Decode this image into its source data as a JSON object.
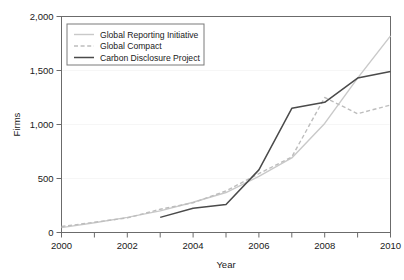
{
  "chart_data": {
    "type": "line",
    "title": "",
    "xlabel": "Year",
    "ylabel": "Firms",
    "xlim": [
      2000,
      2010
    ],
    "ylim": [
      0,
      2000
    ],
    "grid": false,
    "legend_position": "top-left",
    "x": [
      2000,
      2001,
      2002,
      2003,
      2004,
      2005,
      2006,
      2007,
      2008,
      2009,
      2010
    ],
    "x_ticks": [
      2000,
      2001,
      2002,
      2003,
      2004,
      2005,
      2006,
      2007,
      2008,
      2009,
      2010
    ],
    "x_tick_labels": [
      "2000",
      "",
      "2002",
      "",
      "2004",
      "",
      "2006",
      "",
      "2008",
      "",
      "2010"
    ],
    "y_ticks": [
      0,
      500,
      1000,
      1500,
      2000
    ],
    "y_tick_labels": [
      "0",
      "500",
      "1,000",
      "1,500",
      "2,000"
    ],
    "series": [
      {
        "name": "Global Reporting Initiative",
        "color": "#c9c9c9",
        "style": "solid",
        "x": [
          2000,
          2001,
          2002,
          2003,
          2004,
          2005,
          2006,
          2007,
          2008,
          2009,
          2010
        ],
        "values": [
          45,
          90,
          140,
          200,
          280,
          370,
          520,
          690,
          1010,
          1430,
          1820
        ]
      },
      {
        "name": "Global Compact",
        "color": "#bdbdbd",
        "style": "dashed",
        "x": [
          2000,
          2001,
          2002,
          2003,
          2004,
          2005,
          2006,
          2007,
          2008,
          2009,
          2010
        ],
        "values": [
          55,
          95,
          135,
          215,
          275,
          385,
          545,
          700,
          1250,
          1100,
          1180
        ]
      },
      {
        "name": "Carbon Disclosure Project",
        "color": "#4a4a4a",
        "style": "solid",
        "x": [
          2003,
          2004,
          2005,
          2006,
          2007,
          2008,
          2009,
          2010
        ],
        "values": [
          140,
          225,
          260,
          580,
          1150,
          1205,
          1430,
          1490
        ]
      }
    ]
  },
  "legend": {
    "entries": [
      {
        "label": "Global Reporting Initiative"
      },
      {
        "label": "Global Compact"
      },
      {
        "label": "Carbon Disclosure Project"
      }
    ]
  },
  "axes": {
    "x_title": "Year",
    "y_title": "Firms"
  }
}
